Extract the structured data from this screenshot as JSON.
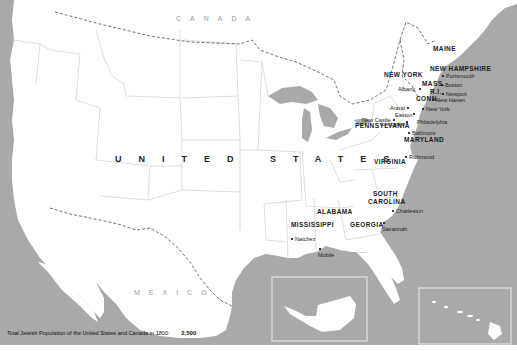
{
  "map": {
    "title_caption": "Total Jewish Population of the United States and Canada in 1800:",
    "total_population": "2,500",
    "countries": {
      "canada": "CANADA",
      "united_states": "UNITED STATES",
      "mexico": "MEXICO"
    },
    "states": [
      {
        "name": "MAINE"
      },
      {
        "name": "NEW HAMPSHIRE"
      },
      {
        "name": "NEW YORK"
      },
      {
        "name": "MASS."
      },
      {
        "name": "R.I."
      },
      {
        "name": "CONN."
      },
      {
        "name": "PENNSYLVANIA"
      },
      {
        "name": "MARYLAND"
      },
      {
        "name": "VIRGINIA"
      },
      {
        "name": "SOUTH"
      },
      {
        "name": "CAROLINA"
      },
      {
        "name": "ALABAMA"
      },
      {
        "name": "MISSISSIPPI"
      },
      {
        "name": "GEORGIA"
      }
    ],
    "cities": [
      {
        "name": "Portsmouth"
      },
      {
        "name": "Albany"
      },
      {
        "name": "Boston"
      },
      {
        "name": "Newport"
      },
      {
        "name": "Ararat"
      },
      {
        "name": "New Haven"
      },
      {
        "name": "Easton"
      },
      {
        "name": "New York"
      },
      {
        "name": "Lancaster"
      },
      {
        "name": "New Castle"
      },
      {
        "name": "Philadelphia"
      },
      {
        "name": "Baltimore"
      },
      {
        "name": "Richmond"
      },
      {
        "name": "Charleston"
      },
      {
        "name": "Savannah"
      },
      {
        "name": "Natchez"
      },
      {
        "name": "Mobile"
      }
    ],
    "insets": [
      "alaska-inset",
      "hawaii-inset"
    ],
    "colors": {
      "water": "#a9a9a9",
      "land": "#ffffff",
      "border": "#cfcfcf",
      "frame": "#e6e6e6"
    }
  }
}
